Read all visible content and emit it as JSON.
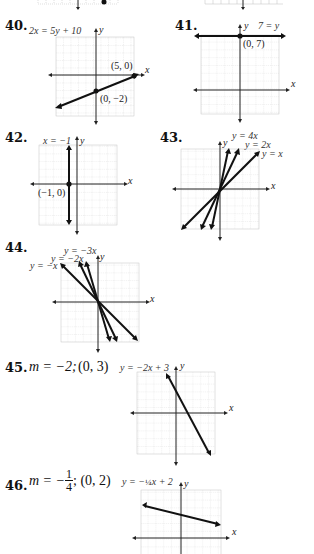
{
  "problems": [
    {
      "number": "40.",
      "equation": "2x = 5y + 10",
      "points": [
        "(5, 0)",
        "(0, −2)"
      ],
      "axis_x": "x",
      "axis_y": "y"
    },
    {
      "number": "41.",
      "equation": "7 = y",
      "points": [
        "(0, 7)"
      ],
      "axis_x": "x",
      "axis_y": "y"
    },
    {
      "number": "42.",
      "equation": "x = −1",
      "points": [
        "(−1, 0)"
      ],
      "axis_x": "x",
      "axis_y": "y"
    },
    {
      "number": "43.",
      "equations": [
        "y = 4x",
        "y = 2x",
        "y = x"
      ],
      "axis_x": "x",
      "axis_y": "y"
    },
    {
      "number": "44.",
      "equations": [
        "y = −3x",
        "y = −2x",
        "y = −x"
      ],
      "axis_x": "x",
      "axis_y": "y"
    },
    {
      "number": "45.",
      "given_m": "m = −2;",
      "given_point": "(0, 3)",
      "equation": "y = −2x + 3",
      "axis_x": "x",
      "axis_y": "y"
    },
    {
      "number": "46.",
      "given_m_prefix": "m = −",
      "given_m_num": "1",
      "given_m_den": "4",
      "given_point": "; (0, 2)",
      "equation_prefix": "y = −",
      "equation_frac": "¼",
      "equation_suffix": "x + 2",
      "axis_x": "x",
      "axis_y": "y"
    }
  ],
  "colors": {
    "grid": "#bdbdbd",
    "axis": "#222222",
    "line": "#111111",
    "text": "#1a1a1a"
  }
}
